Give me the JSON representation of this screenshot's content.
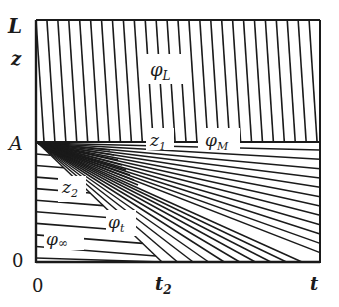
{
  "figure": {
    "type": "characteristics diagram",
    "axes": {
      "x_label": "t",
      "y_label": "z",
      "x_origin_label": "0",
      "y_origin_label": "0",
      "x_tick_label": "t",
      "x_tick_t2": "t",
      "x_tick_t2_sub": "2",
      "y_top_label": "L",
      "y_mid_label": "A"
    },
    "regions": {
      "upper": {
        "symbol": "φ",
        "sub": "L"
      },
      "middle": {
        "symbol": "φ",
        "sub": "M"
      },
      "fan": {
        "symbol": "φ",
        "sub": "t"
      },
      "lower": {
        "symbol": "φ",
        "sub": "∞"
      }
    },
    "boundaries": {
      "z1": {
        "symbol": "z",
        "sub": "1"
      },
      "z2": {
        "symbol": "z",
        "sub": "2"
      }
    },
    "geometry": {
      "box": {
        "left": 36,
        "right": 320,
        "top": 20,
        "mid": 142,
        "bottom": 262
      },
      "t2_x": 162,
      "upper_hatch_count": 26,
      "fan_line_count": 22,
      "lower_line_count": 9
    },
    "colors": {
      "ink": "#1a1a1a",
      "background": "#ffffff"
    }
  }
}
